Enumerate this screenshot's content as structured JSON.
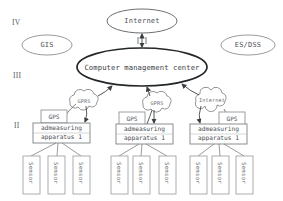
{
  "diagram": {
    "background_color": "#ffffff",
    "stroke_color": "#6b6f72",
    "emphasis_stroke_color": "#2b2f33",
    "text_color": "#4e5255"
  },
  "levels": [
    {
      "id": "level-4",
      "label": "IV",
      "x": 12,
      "y": 22
    },
    {
      "id": "level-3",
      "label": "III",
      "x": 13,
      "y": 75
    },
    {
      "id": "level-2",
      "label": "II",
      "x": 14,
      "y": 125
    }
  ],
  "ellipses": [
    {
      "id": "internet-top",
      "label": "Internet",
      "cx": 142,
      "cy": 21,
      "rx": 35,
      "ry": 12,
      "emphasis": false
    },
    {
      "id": "gis",
      "label": "GIS",
      "cx": 47,
      "cy": 45,
      "rx": 25,
      "ry": 10,
      "emphasis": false
    },
    {
      "id": "es-dss",
      "label": "ES/DSS",
      "cx": 248,
      "cy": 45,
      "rx": 27,
      "ry": 10,
      "emphasis": false
    },
    {
      "id": "computer-management-center",
      "label": "Computer management center",
      "cx": 142,
      "cy": 67,
      "rx": 65,
      "ry": 19,
      "emphasis": true
    }
  ],
  "clouds": [
    {
      "id": "cloud-gprs-1",
      "label": "GPRS",
      "cx": 84,
      "cy": 101
    },
    {
      "id": "cloud-gprs-2",
      "label": "GPRS",
      "cx": 157,
      "cy": 103
    },
    {
      "id": "cloud-internet",
      "label": "Internet",
      "cx": 212,
      "cy": 100
    }
  ],
  "gps_boxes": [
    {
      "id": "gps-box-1",
      "label": "GPS",
      "x": 41,
      "y": 110,
      "w": 26,
      "h": 13
    },
    {
      "id": "gps-box-2",
      "label": "GPS",
      "x": 119,
      "y": 112,
      "w": 26,
      "h": 13
    },
    {
      "id": "gps-box-3",
      "label": "GPS",
      "x": 219,
      "y": 112,
      "w": 26,
      "h": 13
    }
  ],
  "apparatus": [
    {
      "id": "apparatus-1",
      "line1": "admeasuring",
      "line2": "apparatus 1",
      "x": 33,
      "y": 123,
      "w": 57,
      "h": 20
    },
    {
      "id": "apparatus-2",
      "line1": "admeasuring",
      "line2": "apparatus 1",
      "x": 116,
      "y": 124,
      "w": 57,
      "h": 20
    },
    {
      "id": "apparatus-3",
      "line1": "admeasuring",
      "line2": "apparatus 1",
      "x": 190,
      "y": 124,
      "w": 57,
      "h": 20
    }
  ],
  "sensors": [
    {
      "id": "sensor-1-1",
      "label": "Sensor",
      "x": 23,
      "y": 156,
      "w": 17,
      "h": 38
    },
    {
      "id": "sensor-1-2",
      "label": "Sensor",
      "x": 48,
      "y": 156,
      "w": 17,
      "h": 38
    },
    {
      "id": "sensor-1-3",
      "label": "Sensor",
      "x": 73,
      "y": 156,
      "w": 17,
      "h": 38
    },
    {
      "id": "sensor-2-1",
      "label": "Sensor",
      "x": 111,
      "y": 156,
      "w": 17,
      "h": 38
    },
    {
      "id": "sensor-2-2",
      "label": "Sensor",
      "x": 133,
      "y": 156,
      "w": 17,
      "h": 38
    },
    {
      "id": "sensor-2-3",
      "label": "Sensor",
      "x": 159,
      "y": 156,
      "w": 17,
      "h": 38
    },
    {
      "id": "sensor-3-1",
      "label": "Sensor",
      "x": 190,
      "y": 156,
      "w": 17,
      "h": 38
    },
    {
      "id": "sensor-3-2",
      "label": "Sensor",
      "x": 212,
      "y": 156,
      "w": 17,
      "h": 38
    },
    {
      "id": "sensor-3-3",
      "label": "Sensor",
      "x": 236,
      "y": 156,
      "w": 17,
      "h": 38
    }
  ],
  "connectors": {
    "internet_to_center": "bidirectional",
    "clouds_to_center": "upward-arrow",
    "apparatus_to_cloud": "upward-arrow",
    "gps_to_apparatus": "downward-arrow",
    "apparatus_to_sensors": "plain-line"
  }
}
